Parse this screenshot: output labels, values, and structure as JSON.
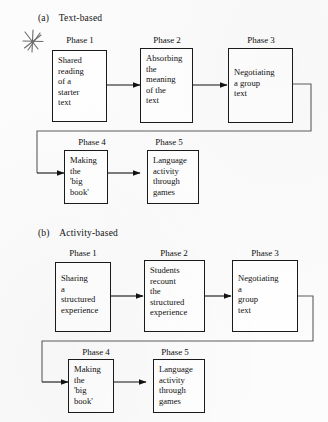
{
  "page": {
    "background_color": "#fcfcfc",
    "ink_color": "#1a1a1a"
  },
  "annotations": {
    "star_marker": {
      "icon": "hand-drawn-star-icon",
      "color": "#5a5a5a"
    }
  },
  "diagrams": [
    {
      "id": "text-based",
      "index_label": "(a)",
      "title": "Text-based",
      "top_row": [
        {
          "phase_label": "Phase 1",
          "lines": [
            "Shared",
            "reading",
            "of a",
            "starter",
            "text"
          ]
        },
        {
          "phase_label": "Phase 2",
          "lines": [
            "Absorbing",
            "the",
            "meaning",
            "of the",
            "text"
          ]
        },
        {
          "phase_label": "Phase 3",
          "lines": [
            "Negotiating",
            "a group",
            "text"
          ]
        }
      ],
      "bottom_row": [
        {
          "phase_label": "Phase 4",
          "lines": [
            "Making",
            "the",
            "'big",
            "book'"
          ]
        },
        {
          "phase_label": "Phase 5",
          "lines": [
            "Language",
            "activity",
            "through",
            "games"
          ]
        }
      ]
    },
    {
      "id": "activity-based",
      "index_label": "(b)",
      "title": "Activity-based",
      "top_row": [
        {
          "phase_label": "Phase 1",
          "lines": [
            "Sharing",
            "a",
            "structured",
            "experience"
          ]
        },
        {
          "phase_label": "Phase 2",
          "lines": [
            "Students",
            "recount",
            "the",
            "structured",
            "experience"
          ]
        },
        {
          "phase_label": "Phase 3",
          "lines": [
            "Negotiating",
            "a",
            "group",
            "text"
          ]
        }
      ],
      "bottom_row": [
        {
          "phase_label": "Phase 4",
          "lines": [
            "Making",
            "the",
            "'big",
            "book'"
          ]
        },
        {
          "phase_label": "Phase 5",
          "lines": [
            "Language",
            "activity",
            "through",
            "games"
          ]
        }
      ]
    }
  ]
}
